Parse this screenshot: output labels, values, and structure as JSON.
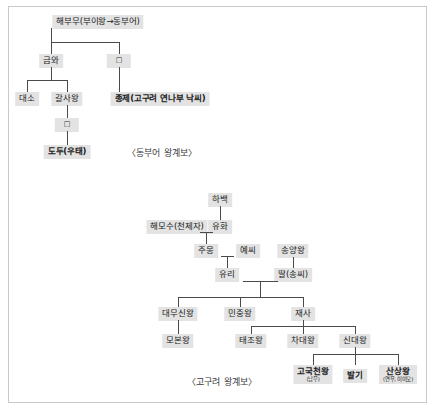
{
  "diagram_dongbuyeo": {
    "caption": "〈동부어 왕계보〉",
    "nodes": {
      "haebumu": "해부무(부이왕→동부어)",
      "geumwa": "금와",
      "unnamed_child": "□",
      "daeso": "대소",
      "galsawang": "갈사왕",
      "jongje": "종제(고구려 연나부 낙씨)",
      "unnamed_descendant": "□",
      "dodu": "도두(우태)"
    }
  },
  "diagram_goguryeo": {
    "caption": "〈고구려 왕계보〉",
    "nodes": {
      "habaek": "하백",
      "haemosu": "해모수(천제자)",
      "yuhwa": "유화",
      "jumong": "주몽",
      "yessi": "예씨",
      "songyangwang": "송양왕",
      "yuri": "유리",
      "daughter_song": "딸(송씨)",
      "daemusinwang": "대무신왕",
      "minjungwang": "민중왕",
      "jaesa": "재사",
      "mobonwang": "모본왕",
      "taejowang": "태조왕",
      "chadaewang": "차대왕",
      "sindaewang": "신대왕",
      "gogukcheonwang": "고국천왕",
      "gogukcheonwang_sub": "(남무)",
      "balgi": "발기",
      "sansangwang": "산상왕",
      "sansangwang_sub": "(연우, 이이모)"
    }
  },
  "colors": {
    "node_fill": "#e3e3e3",
    "line": "#4a4a4a",
    "frame": "#c9c9c9",
    "text": "#1a1a1a"
  }
}
